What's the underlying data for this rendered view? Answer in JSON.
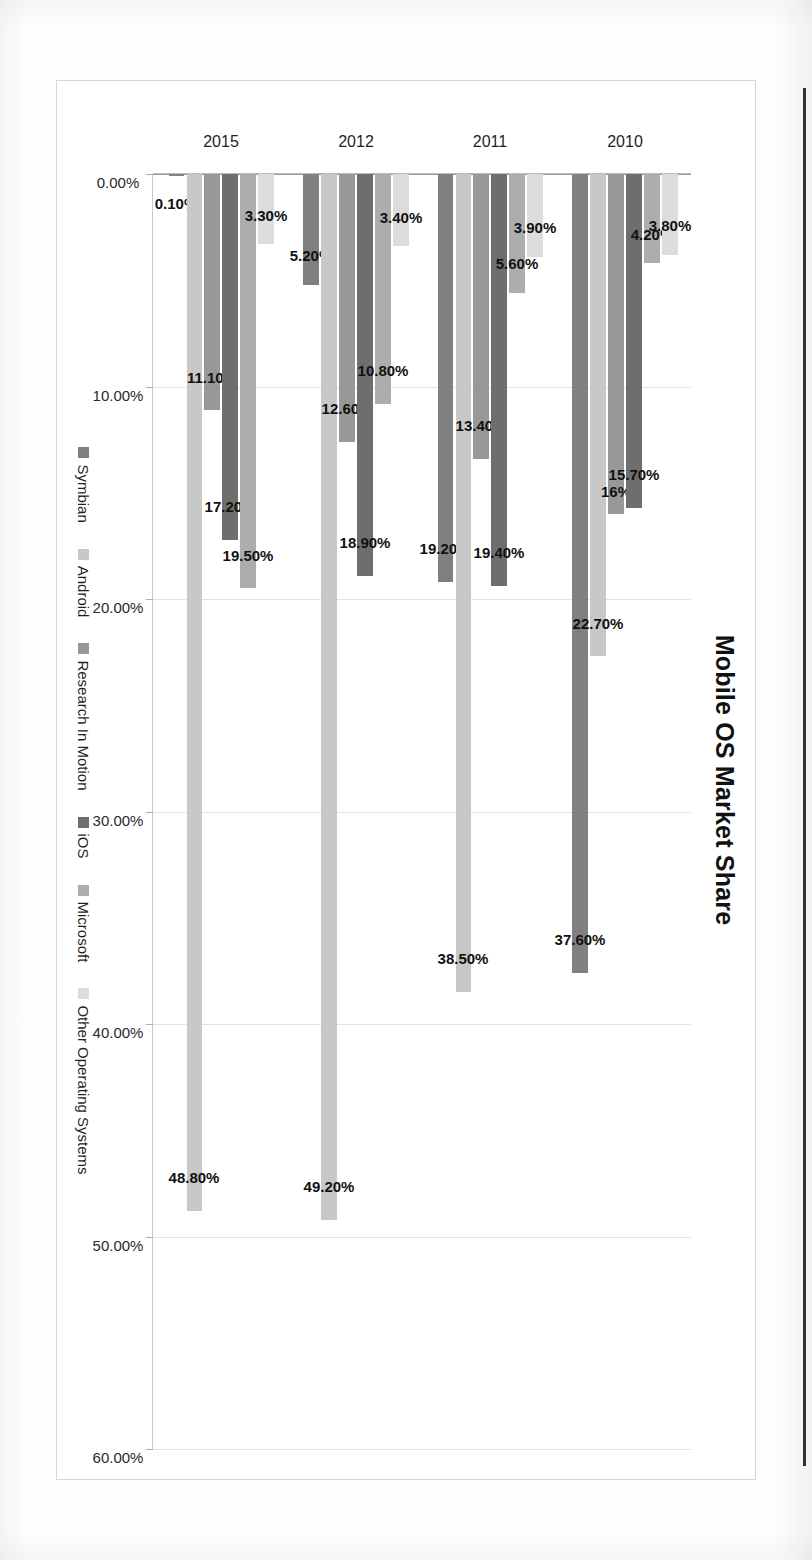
{
  "document": {
    "type": "scanned-chart-page",
    "orientation": "rotated-90-clockwise"
  },
  "chart_data": {
    "type": "bar",
    "orientation": "vertical",
    "title": "Mobile OS Market Share",
    "xlabel": "",
    "ylabel": "",
    "ylim": [
      0,
      60
    ],
    "grid": true,
    "legend_position": "bottom",
    "categories": [
      "2010",
      "2011",
      "2012",
      "2015"
    ],
    "tick_labels": [
      "0.00%",
      "10.00%",
      "20.00%",
      "30.00%",
      "40.00%",
      "50.00%",
      "60.00%"
    ],
    "tick_values": [
      0,
      10,
      20,
      30,
      40,
      50,
      60
    ],
    "series": [
      {
        "name": "Symbian",
        "color": "#808080",
        "values": [
          37.6,
          19.2,
          5.2,
          0.1
        ],
        "labels": [
          "37.60%",
          "19.20%",
          "5.20%",
          "0.10%"
        ]
      },
      {
        "name": "Android",
        "color": "#c8c8c8",
        "values": [
          22.7,
          38.5,
          49.2,
          48.8
        ],
        "labels": [
          "22.70%",
          "38.50%",
          "49.20%",
          "48.80%"
        ]
      },
      {
        "name": "Research In Motion",
        "color": "#989898",
        "values": [
          16.0,
          13.4,
          12.6,
          11.1
        ],
        "labels": [
          "16%",
          "13.40%",
          "12.60%",
          "11.10%"
        ]
      },
      {
        "name": "iOS",
        "color": "#6e6e6e",
        "values": [
          15.7,
          19.4,
          18.9,
          17.2
        ],
        "labels": [
          "15.70%",
          "19.40%",
          "18.90%",
          "17.20%"
        ]
      },
      {
        "name": "Microsoft",
        "color": "#adadad",
        "values": [
          4.2,
          5.6,
          10.8,
          19.5
        ],
        "labels": [
          "4.20%",
          "5.60%",
          "10.80%",
          "19.50%"
        ]
      },
      {
        "name": "Other Operating Systems",
        "color": "#dcdcdc",
        "values": [
          3.8,
          3.9,
          3.4,
          3.3
        ],
        "labels": [
          "3.80%",
          "3.90%",
          "3.40%",
          "3.30%"
        ]
      }
    ]
  }
}
